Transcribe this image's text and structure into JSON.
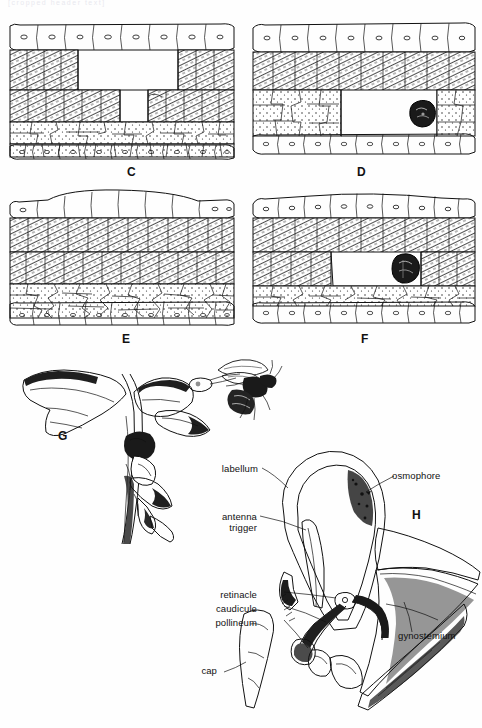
{
  "figure": {
    "top_fragment": "[cropped header text]",
    "panels": [
      {
        "id": "C",
        "label": "C",
        "caption_role": "cross-section, cavity formed in mesophyll"
      },
      {
        "id": "D",
        "label": "D",
        "caption_role": "cross-section with dark pollinium mass at right"
      },
      {
        "id": "E",
        "label": "E",
        "caption_role": "intact cross-section, dense palisade layers"
      },
      {
        "id": "F",
        "label": "F",
        "caption_role": "cross-section with cavity and dark pollinium"
      },
      {
        "id": "G",
        "label": "G",
        "caption_role": "orchid flower in lateral view with visiting bee"
      },
      {
        "id": "H",
        "label": "H",
        "caption_role": "labellum and gynostemium longitudinal section"
      }
    ],
    "annotations": [
      {
        "key": "labellum",
        "text": "labellum"
      },
      {
        "key": "osmophore",
        "text": "osmophore"
      },
      {
        "key": "antenna",
        "text": "antenna"
      },
      {
        "key": "trigger",
        "text": "trigger"
      },
      {
        "key": "retinacle",
        "text": "retinacle"
      },
      {
        "key": "caudicule",
        "text": "caudicule"
      },
      {
        "key": "pollineum",
        "text": "pollineum"
      },
      {
        "key": "cap",
        "text": "cap"
      },
      {
        "key": "gynostemium",
        "text": "gynostemium"
      }
    ],
    "colors": {
      "ink": "#111111",
      "paper": "#fefefe",
      "fill_light": "#f2f2f2",
      "fill_dark": "#1a1a1a"
    }
  }
}
